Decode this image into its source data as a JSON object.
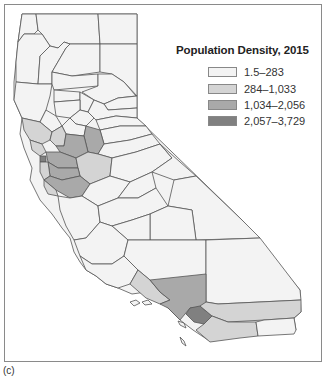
{
  "figure": {
    "caption": "(c)"
  },
  "legend": {
    "title": "Population Density, 2015",
    "items": [
      {
        "label": "1.5–283",
        "color": "#f3f3f3"
      },
      {
        "label": "284–1,033",
        "color": "#d4d4d4"
      },
      {
        "label": "1,034–2,056",
        "color": "#a9a9a9"
      },
      {
        "label": "2,057–3,729",
        "color": "#808080"
      }
    ]
  },
  "map": {
    "region": "California counties",
    "classes": {
      "c1": "#f3f3f3",
      "c2": "#d4d4d4",
      "c3": "#a9a9a9",
      "c4": "#808080"
    }
  }
}
